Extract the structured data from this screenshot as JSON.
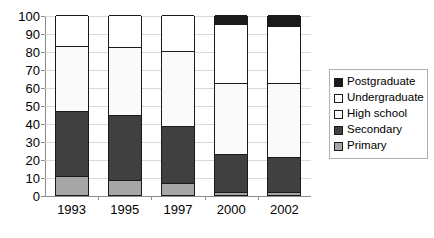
{
  "chart_data": {
    "type": "bar",
    "subtype": "stacked-bar",
    "title": "",
    "xlabel": "",
    "ylabel": "",
    "categories": [
      "1993",
      "1995",
      "1997",
      "2000",
      "2002"
    ],
    "ylim": [
      0,
      100
    ],
    "yticks": [
      0,
      10,
      20,
      30,
      40,
      50,
      60,
      70,
      80,
      90,
      100
    ],
    "ytick_labels": [
      "0",
      "10",
      "20",
      "30",
      "40",
      "50",
      "60",
      "70",
      "80",
      "90",
      "100"
    ],
    "grid": true,
    "legend_position": "right",
    "stack_order_bottom_to_top": [
      "Primary",
      "Secondary",
      "High school",
      "Undergraduate",
      "Postgraduate"
    ],
    "series": [
      {
        "name": "Primary",
        "color": "#a6a6a6",
        "values": [
          10.5,
          8.5,
          6.5,
          1.5,
          1.5
        ]
      },
      {
        "name": "Secondary",
        "color": "#404040",
        "values": [
          36,
          36,
          32,
          21.5,
          19.5
        ]
      },
      {
        "name": "High school",
        "color": "#fafafa",
        "values": [
          36.5,
          37.5,
          41.5,
          39,
          41
        ]
      },
      {
        "name": "Undergraduate",
        "color": "#ffffff",
        "values": [
          17,
          18,
          20,
          33,
          32
        ]
      },
      {
        "name": "Postgraduate",
        "color": "#1a1a1a",
        "values": [
          0,
          0,
          0,
          5,
          6
        ]
      }
    ],
    "cumulative_tops": {
      "1993": {
        "Primary": 10.5,
        "Secondary": 46.5,
        "High school": 83,
        "Undergraduate": 100,
        "Postgraduate": 100
      },
      "1995": {
        "Primary": 8.5,
        "Secondary": 44.5,
        "High school": 82,
        "Undergraduate": 100,
        "Postgraduate": 100
      },
      "1997": {
        "Primary": 6.5,
        "Secondary": 38.5,
        "High school": 80,
        "Undergraduate": 100,
        "Postgraduate": 100
      },
      "2000": {
        "Primary": 1.5,
        "Secondary": 23,
        "High school": 62,
        "Undergraduate": 95,
        "Postgraduate": 100
      },
      "2002": {
        "Primary": 1.5,
        "Secondary": 21,
        "High school": 62,
        "Undergraduate": 94,
        "Postgraduate": 100
      }
    }
  },
  "legend": {
    "items": [
      {
        "label": "Postgraduate",
        "color": "#1a1a1a"
      },
      {
        "label": "Undergraduate",
        "color": "#ffffff"
      },
      {
        "label": "High school",
        "color": "#fafafa"
      },
      {
        "label": "Secondary",
        "color": "#404040"
      },
      {
        "label": "Primary",
        "color": "#a6a6a6"
      }
    ]
  },
  "colors": {
    "postgraduate": "#1a1a1a",
    "undergraduate": "#ffffff",
    "high_school": "#fafafa",
    "secondary": "#404040",
    "primary": "#a6a6a6",
    "gridline": "#d9d9d9",
    "axis": "#8c8c8c",
    "outline": "#1a1a1a",
    "background": "#ffffff"
  }
}
